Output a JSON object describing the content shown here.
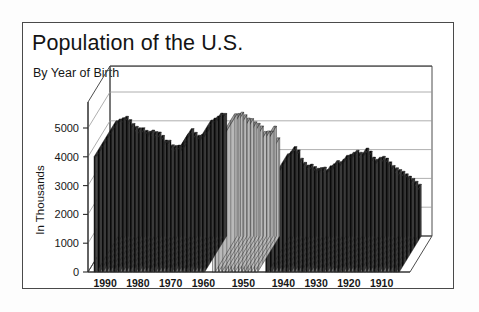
{
  "header": {
    "title": "Population of the U.S.",
    "subtitle": "By Year of Birth"
  },
  "chart_data": {
    "type": "bar",
    "title": "Population of the U.S.",
    "subtitle": "By Year of Birth",
    "xlabel": "",
    "ylabel": "In Thousands",
    "ylim": [
      0,
      5000
    ],
    "yticks": [
      0,
      1000,
      2000,
      3000,
      4000,
      5000
    ],
    "ytick_labels": [
      "0",
      "1000",
      "2000",
      "3000",
      "4000",
      "5000"
    ],
    "xtick_labels": [
      "1990",
      "1980",
      "1970",
      "1960",
      "1950",
      "1940",
      "1930",
      "1920",
      "1910"
    ],
    "xtick_values": [
      1990,
      1980,
      1970,
      1960,
      1950,
      1940,
      1930,
      1920,
      1910
    ],
    "x_axis_direction": "descending",
    "grid": true,
    "legend": false,
    "projection": "3d-bar",
    "note": "Births per year in thousands; x axis runs from 1990 on the left down to about 1905 on the right. Bars are drawn in three shaded runs separated by gaps.",
    "series": [
      {
        "name": "1960-1993 births",
        "shade": "dark",
        "x": [
          1993,
          1992,
          1991,
          1990,
          1989,
          1988,
          1987,
          1986,
          1985,
          1984,
          1983,
          1982,
          1981,
          1980,
          1979,
          1978,
          1977,
          1976,
          1975,
          1974,
          1973,
          1972,
          1971,
          1970,
          1969,
          1968,
          1967,
          1966,
          1965,
          1964,
          1963,
          1962,
          1961,
          1960
        ],
        "values": [
          4000,
          4065,
          4110,
          4158,
          4041,
          3910,
          3809,
          3757,
          3761,
          3669,
          3639,
          3681,
          3629,
          3612,
          3494,
          3333,
          3327,
          3168,
          3144,
          3160,
          3137,
          3258,
          3556,
          3731,
          3600,
          3502,
          3521,
          3606,
          3760,
          4027,
          4098,
          4167,
          4268,
          4258
        ]
      },
      {
        "name": "1946-1959 births",
        "shade": "light",
        "x": [
          1959,
          1958,
          1957,
          1956,
          1955,
          1954,
          1953,
          1952,
          1951,
          1950,
          1949,
          1948,
          1947,
          1946
        ],
        "values": [
          4245,
          4255,
          4300,
          4210,
          4097,
          4078,
          3965,
          3913,
          3823,
          3632,
          3649,
          3637,
          3817,
          3411
        ]
      },
      {
        "name": "1905-1945 births",
        "shade": "dark",
        "x": [
          1945,
          1944,
          1943,
          1942,
          1941,
          1940,
          1939,
          1938,
          1937,
          1936,
          1935,
          1934,
          1933,
          1932,
          1931,
          1930,
          1929,
          1928,
          1927,
          1926,
          1925,
          1924,
          1923,
          1922,
          1921,
          1920,
          1919,
          1918,
          1917,
          1916,
          1915,
          1914,
          1913,
          1912,
          1911,
          1910,
          1909,
          1908,
          1907,
          1906,
          1905
        ],
        "values": [
          2858,
          2939,
          3104,
          2989,
          2703,
          2559,
          2466,
          2496,
          2413,
          2355,
          2377,
          2396,
          2307,
          2440,
          2506,
          2618,
          2582,
          2674,
          2802,
          2839,
          2909,
          2979,
          2910,
          2882,
          3055,
          2950,
          2740,
          2666,
          2735,
          2769,
          2704,
          2574,
          2450,
          2370,
          2310,
          2250,
          2160,
          2080,
          2000,
          1900,
          1800
        ]
      }
    ]
  }
}
